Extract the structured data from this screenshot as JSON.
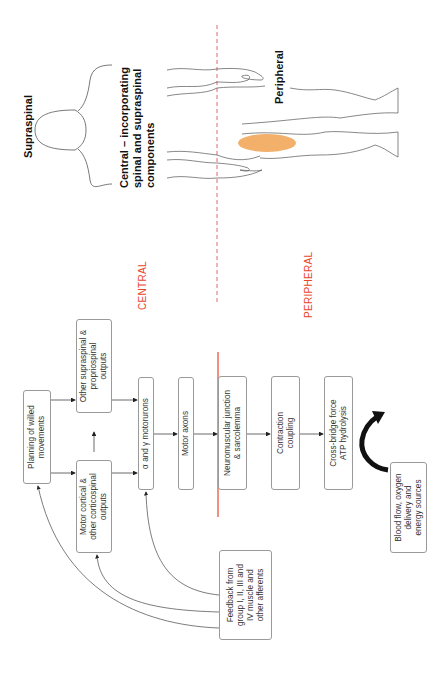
{
  "figure": {
    "orientation": "rotated -90deg",
    "regions": {
      "central_label": "CENTRAL",
      "peripheral_label": "PERIPHERAL",
      "divider_color": "#e8452c"
    },
    "body_illustration": {
      "supraspinal_label": "Supraspinal",
      "central_label": "Central – incorporating\nspinal and supraspinal\ncomponents",
      "peripheral_label": "Peripheral",
      "muscle_highlight_color": "#f2b06a"
    },
    "boxes": {
      "planning": "Planning of willed\nmovements",
      "motor_cortical": "Motor cortical &\nother corticospinal\noutputs",
      "other_supraspinal": "Other supraspinal &\npropriospinal\noutputs",
      "motoneurons": "α and γ motorurons",
      "motor_axons": "Motor axons",
      "nmj": "Neuromuscular junction\n& sarcolemma",
      "contraction": "Contraction\ncoupling",
      "cross_bridge": "Cross-bridge force\nATP hydrolysis",
      "blood_flow": "Blood flow, oxygen\ndelivery and\nenergy sources",
      "feedback": "Feedback from\ngroup I, II, III and\nIV muscle and\nother afferents"
    }
  }
}
